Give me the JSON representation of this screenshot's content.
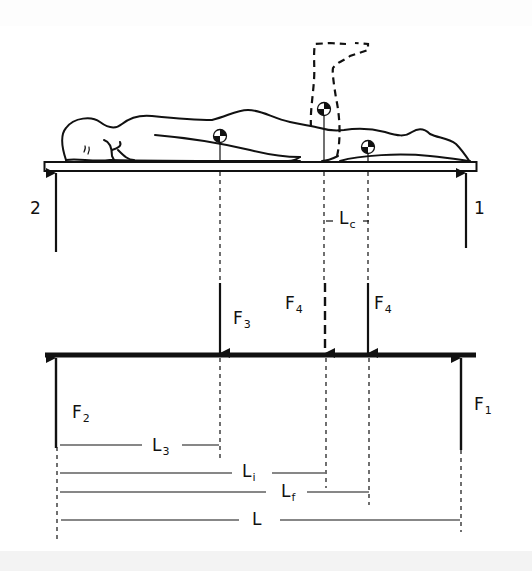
{
  "figure": {
    "colors": {
      "line": "#111111",
      "background": "#ffffff",
      "band": "#f3f3f3"
    }
  },
  "top_view": {
    "support_labels": {
      "left": "2",
      "right": "1"
    },
    "distance_label": {
      "main": "L",
      "sub": "c"
    }
  },
  "forces": {
    "f3": {
      "main": "F",
      "sub": "3"
    },
    "f4_initial": {
      "main": "F",
      "sub": "4"
    },
    "f4_final": {
      "main": "F",
      "sub": "4"
    },
    "f2": {
      "main": "F",
      "sub": "2"
    },
    "f1": {
      "main": "F",
      "sub": "1"
    }
  },
  "dimensions": {
    "l3": {
      "main": "L",
      "sub": "3"
    },
    "li": {
      "main": "L",
      "sub": "i"
    },
    "lf": {
      "main": "L",
      "sub": "f"
    },
    "l": {
      "main": "L",
      "sub": ""
    }
  }
}
